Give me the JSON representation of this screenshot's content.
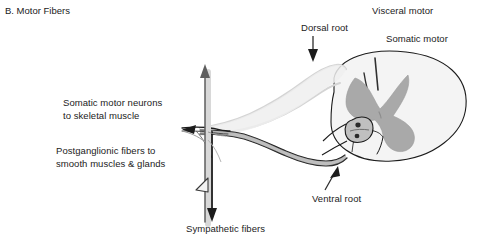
{
  "figure": {
    "panel_title": "B. Motor Fibers",
    "background_color": "#ffffff",
    "width": 481,
    "height": 239
  },
  "labels": {
    "somatic_motor_neurons": "Somatic motor neurons\nto skeletal muscle",
    "postganglionic_fibers": "Postganglionic fibers to\nsmooth muscles & glands",
    "sympathetic_fibers": "Sympathetic fibers",
    "dorsal_root": "Dorsal root",
    "ventral_root": "Ventral root",
    "visceral_motor": "Visceral motor",
    "somatic_motor": "Somatic motor"
  },
  "colors": {
    "text": "#222222",
    "outline": "#1c1c1c",
    "gray_matter": "#a9a9a9",
    "white_matter": "#f4f4f4",
    "pale_nerve": "#d8d8d8",
    "ganglion_fill": "#c4c4c4",
    "arrow": "#3a3a3a"
  },
  "anatomy": {
    "structures": [
      "spinal-cord-cross-section",
      "gray-matter-butterfly",
      "dorsal-root",
      "ventral-root",
      "sympathetic-ganglion",
      "spinal-nerve",
      "somatic-motor-axon",
      "postganglionic-axon",
      "sympathetic-fiber-trunk"
    ]
  }
}
